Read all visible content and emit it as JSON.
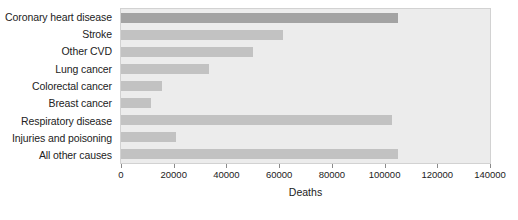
{
  "chart_data": {
    "type": "bar",
    "orientation": "horizontal",
    "title": "",
    "xlabel": "Deaths",
    "ylabel": "",
    "xlim": [
      0,
      140000
    ],
    "xticks": [
      0,
      20000,
      40000,
      60000,
      80000,
      100000,
      120000,
      140000
    ],
    "xtick_labels": [
      "0",
      "20000",
      "40000",
      "60000",
      "80000",
      "100000",
      "120000",
      "140000"
    ],
    "grid": false,
    "legend": "none",
    "categories": [
      "Coronary heart disease",
      "Stroke",
      "Other CVD",
      "Lung cancer",
      "Colorectal cancer",
      "Breast cancer",
      "Respiratory disease",
      "Injuries and poisoning",
      "All other causes"
    ],
    "values": [
      105000,
      61500,
      50000,
      33400,
      15600,
      11400,
      103000,
      20900,
      105000
    ],
    "bar_colors": [
      "#a3a3a3",
      "#c2c2c2",
      "#c2c2c2",
      "#c2c2c2",
      "#c2c2c2",
      "#c2c2c2",
      "#c2c2c2",
      "#c2c2c2",
      "#c2c2c2"
    ],
    "highlight_index": 0,
    "plot_background": "#ececec",
    "plot_border": "#d2d2d2",
    "figure_background": "#ffffff",
    "text_color": "#222222"
  }
}
